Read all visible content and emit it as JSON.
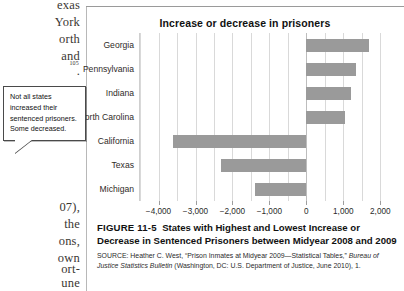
{
  "page_margin_text": {
    "left_column_top": [
      "exas",
      "York",
      "orth",
      "and",
      "."
    ],
    "left_column_superscript": "105",
    "left_column_bottom": [
      "07),",
      "the",
      "ons,",
      "own",
      "ort-",
      "une"
    ]
  },
  "callout": {
    "text": "Not all states increased their sentenced prisoners. Some decreased."
  },
  "caption": {
    "figure_label": "FIGURE 11-5",
    "title": "States with Highest and Lowest Increase or Decrease in Sentenced Prisoners between Midyear 2008 and 2009",
    "source_prefix": "SOURCE:",
    "source_text_1": "Heather C. West, “Prison Inmates at Midyear 2009—Statistical Tables,” ",
    "source_italic_1": "Bureau of Justice Statistics Bulletin",
    "source_text_2": " (Washington, DC: U.S. Department of Justice, June 2010), 1."
  },
  "colors": {
    "bar": "#9a9a9a",
    "gridline": "#d9d9d9",
    "zero_line": "#bdbdbd",
    "text": "#1a1a1a"
  },
  "chart_data": {
    "type": "bar",
    "orientation": "horizontal",
    "title": "Increase or decrease in prisoners",
    "xlabel": "",
    "ylabel": "",
    "categories": [
      "Georgia",
      "Pennsylvania",
      "Indiana",
      "North Carolina",
      "California",
      "Texas",
      "Michigan"
    ],
    "values": [
      1700,
      1350,
      1200,
      1050,
      -3600,
      -2300,
      -1400
    ],
    "xlim": [
      -4500,
      2100
    ],
    "xticks": [
      -4000,
      -3000,
      -2000,
      -1000,
      0,
      1000,
      2000
    ],
    "xticklabels": [
      "−4,000",
      "−3,000",
      "−2,000",
      "−1,000",
      "0",
      "1,000",
      "2,000"
    ],
    "minor_gridline_step": 500,
    "grid": true,
    "legend": false
  }
}
